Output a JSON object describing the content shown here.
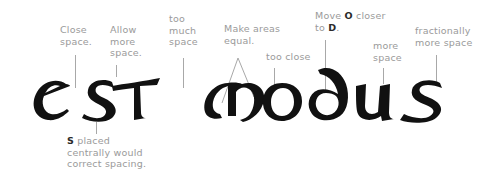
{
  "word": {
    "text": "estmodus",
    "letters": [
      "e",
      "S",
      "T",
      "m",
      "o",
      "d",
      "u",
      "s"
    ],
    "ink_color": "#111111"
  },
  "annotations": {
    "close_space": {
      "lines": [
        "Close",
        "space."
      ]
    },
    "allow_more_space": {
      "lines": [
        "Allow",
        "more",
        "space."
      ]
    },
    "too_much_space": {
      "lines": [
        "too",
        "much",
        "space"
      ]
    },
    "make_areas_equal": {
      "lines": [
        "Make areas",
        "equal."
      ]
    },
    "too_close": {
      "lines": [
        "too close"
      ]
    },
    "move_o_closer": {
      "line1_pre": "Move ",
      "line1_bold": "O",
      "line1_post": " closer",
      "line2_pre": "to ",
      "line2_bold": "D",
      "line2_post": "."
    },
    "more_space": {
      "lines": [
        "more",
        "space"
      ]
    },
    "fractionally_more_space": {
      "lines": [
        "fractionally",
        "more space"
      ]
    },
    "s_placed_centrally": {
      "line1_bold": "S",
      "line1_post": " placed",
      "line2": "centrally would",
      "line3": "correct spacing."
    }
  },
  "colors": {
    "annotation_text": "#9a9a9a",
    "emphasis_text": "#2a2a2a",
    "leader_line": "#a8a8a8",
    "letters": "#111111"
  }
}
